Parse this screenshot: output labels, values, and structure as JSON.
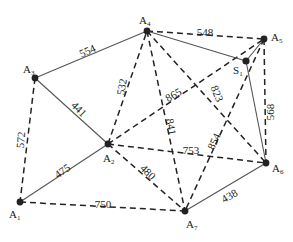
{
  "diagram": {
    "type": "weighted-graph",
    "nodes": [
      {
        "id": "A1",
        "name": "A",
        "sub": "1",
        "x": 20,
        "y": 202,
        "lx": 9,
        "ly": 218
      },
      {
        "id": "A2",
        "name": "A",
        "sub": "2",
        "x": 108,
        "y": 144,
        "lx": 103,
        "ly": 162
      },
      {
        "id": "A3",
        "name": "A",
        "sub": "3",
        "x": 35,
        "y": 78,
        "lx": 23,
        "ly": 73
      },
      {
        "id": "A4",
        "name": "A",
        "sub": "4",
        "x": 147,
        "y": 31,
        "lx": 139,
        "ly": 24
      },
      {
        "id": "A5",
        "name": "A",
        "sub": "5",
        "x": 264,
        "y": 39,
        "lx": 271,
        "ly": 41
      },
      {
        "id": "S1",
        "name": "S",
        "sub": "1",
        "x": 246,
        "y": 61,
        "lx": 233,
        "ly": 74
      },
      {
        "id": "A6",
        "name": "A",
        "sub": "6",
        "x": 266,
        "y": 163,
        "lx": 272,
        "ly": 172
      },
      {
        "id": "A7",
        "name": "A",
        "sub": "7",
        "x": 185,
        "y": 211,
        "lx": 186,
        "ly": 228
      }
    ],
    "edges": [
      {
        "from": "A3",
        "to": "A4",
        "weight": "554",
        "style": "solid",
        "lx": 88,
        "ly": 52,
        "rot": -25
      },
      {
        "from": "A3",
        "to": "A2",
        "weight": "441",
        "style": "solid",
        "lx": 78,
        "ly": 110,
        "rot": 45
      },
      {
        "from": "A1",
        "to": "A2",
        "weight": "475",
        "style": "solid",
        "lx": 63,
        "ly": 172,
        "rot": -35
      },
      {
        "from": "A3",
        "to": "A1",
        "weight": "572",
        "style": "dashed",
        "lx": 22,
        "ly": 140,
        "rot": -85
      },
      {
        "from": "A1",
        "to": "A7",
        "weight": "750",
        "style": "dashed",
        "lx": 103,
        "ly": 205,
        "rot": 0
      },
      {
        "from": "A2",
        "to": "A4",
        "weight": "532",
        "style": "dashed",
        "lx": 123,
        "ly": 87,
        "rot": -80
      },
      {
        "from": "A2",
        "to": "A5",
        "weight": "865",
        "style": "dashed",
        "lx": 174,
        "ly": 96,
        "rot": -30
      },
      {
        "from": "A2",
        "to": "A6",
        "weight": "753",
        "style": "dashed",
        "lx": 191,
        "ly": 151,
        "rot": 0
      },
      {
        "from": "A2",
        "to": "A7",
        "weight": "480",
        "style": "dashed",
        "lx": 147,
        "ly": 173,
        "rot": 45
      },
      {
        "from": "A4",
        "to": "A5",
        "weight": "548",
        "style": "dashed",
        "lx": 205,
        "ly": 33,
        "rot": 0
      },
      {
        "from": "A4",
        "to": "S1",
        "weight": "",
        "style": "solid",
        "lx": 0,
        "ly": 0,
        "rot": 0
      },
      {
        "from": "A4",
        "to": "A7",
        "weight": "841",
        "style": "dashed",
        "lx": 170,
        "ly": 127,
        "rot": 80
      },
      {
        "from": "A4",
        "to": "A6",
        "weight": "823",
        "style": "dashed",
        "lx": 216,
        "ly": 94,
        "rot": 68
      },
      {
        "from": "A5",
        "to": "A6",
        "weight": "568",
        "style": "dashed",
        "lx": 271,
        "ly": 112,
        "rot": -90
      },
      {
        "from": "S1",
        "to": "A6",
        "weight": "",
        "style": "solid",
        "lx": 0,
        "ly": 0,
        "rot": 0
      },
      {
        "from": "A5",
        "to": "S1",
        "weight": "",
        "style": "solid",
        "lx": 0,
        "ly": 0,
        "rot": 0
      },
      {
        "from": "A5",
        "to": "A7",
        "weight": "854",
        "style": "dashed",
        "lx": 215,
        "ly": 142,
        "rot": -65
      },
      {
        "from": "A7",
        "to": "A6",
        "weight": "438",
        "style": "dashed-solid",
        "lx": 230,
        "ly": 197,
        "rot": -30
      }
    ]
  }
}
